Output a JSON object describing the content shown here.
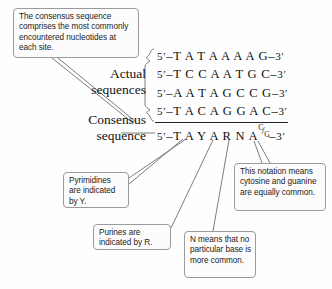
{
  "figure": {
    "background_color": "#fefefe",
    "line_color": "#6d6d6d",
    "box_border_color": "#9b9b9b",
    "text_color": "#1b1b1b"
  },
  "callouts": {
    "consensus_definition": "The consensus sequence comprises the most commonly encountered nucleotides at each site.",
    "pyrimidines": "Pyrimidines are indicated by Y.",
    "purines": "Purines are indicated by R.",
    "n_notation": "N means that no particular base is more common.",
    "cg_notation": "This notation means cytosine and guanine are equally common."
  },
  "labels": {
    "actual_sequences_line1": "Actual",
    "actual_sequences_line2": "sequences",
    "consensus_sequence_line1": "Consensus",
    "consensus_sequence_line2": "sequence"
  },
  "sequences": {
    "five_prime": "5′",
    "three_prime": "3′",
    "dash": "–",
    "actual": [
      "T A T A A A A G",
      "T C C A A T G C",
      "A A T A G C C G",
      "T A C A G G A C"
    ],
    "consensus_prefix": "T A Y A R N A",
    "consensus_ambiguity": {
      "numerator": "C",
      "slash": "/",
      "denominator": "G"
    }
  }
}
